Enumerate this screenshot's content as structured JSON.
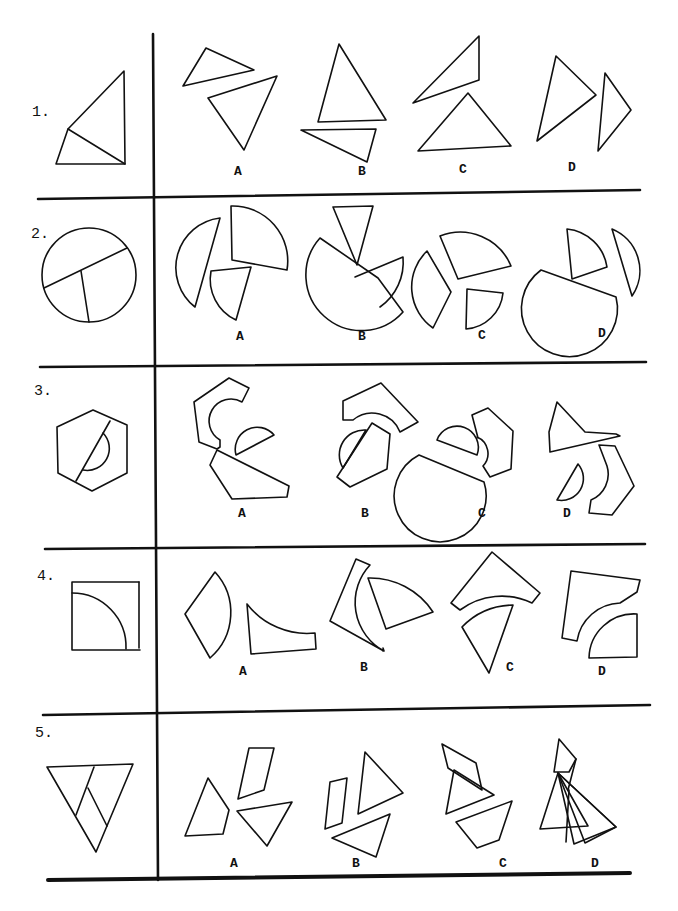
{
  "questions": [
    {
      "number": "1.",
      "original_figure": "triangle divided into two triangles",
      "options": [
        {
          "label": "A",
          "description": "two triangles"
        },
        {
          "label": "B",
          "description": "two triangles"
        },
        {
          "label": "C",
          "description": "two triangles"
        },
        {
          "label": "D",
          "description": "two triangles"
        }
      ]
    },
    {
      "number": "2.",
      "original_figure": "circle divided into three sectors",
      "options": [
        {
          "label": "A",
          "description": "three circle pieces"
        },
        {
          "label": "B",
          "description": "three circle pieces"
        },
        {
          "label": "C",
          "description": "three circle pieces"
        },
        {
          "label": "D",
          "description": "three circle pieces"
        }
      ]
    },
    {
      "number": "3.",
      "original_figure": "hexagon with semicircle cut",
      "options": [
        {
          "label": "A",
          "description": "hexagon pieces with semicircle"
        },
        {
          "label": "B",
          "description": "hexagon pieces with semicircle"
        },
        {
          "label": "C",
          "description": "hexagon pieces with semicircle"
        },
        {
          "label": "D",
          "description": "hexagon pieces with semicircle"
        }
      ]
    },
    {
      "number": "4.",
      "original_figure": "square with quarter circle",
      "options": [
        {
          "label": "A",
          "description": "sector and concave piece"
        },
        {
          "label": "B",
          "description": "sector and concave piece"
        },
        {
          "label": "C",
          "description": "sector and concave piece"
        },
        {
          "label": "D",
          "description": "sector and concave piece"
        }
      ]
    },
    {
      "number": "5.",
      "original_figure": "inverted triangle divided into three pieces",
      "options": [
        {
          "label": "A",
          "description": "three polygon pieces"
        },
        {
          "label": "B",
          "description": "three polygon pieces"
        },
        {
          "label": "C",
          "description": "three polygon pieces"
        },
        {
          "label": "D",
          "description": "three polygon pieces"
        }
      ]
    }
  ]
}
